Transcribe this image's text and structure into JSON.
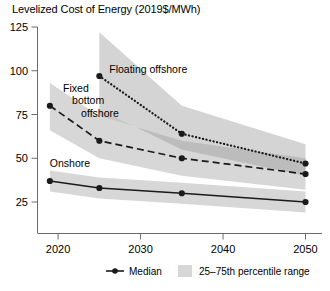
{
  "chart_data": {
    "type": "line",
    "title": "Levelized Cost of Energy (2019$/MWh)",
    "xlabel": "",
    "ylabel": "Levelized Cost of Energy (2019$/MWh)",
    "xlim": [
      2017.5,
      2052
    ],
    "ylim": [
      12,
      125
    ],
    "grid": false,
    "x_ticks": [
      "2020",
      "2030",
      "2040",
      "2050"
    ],
    "x_tick_values": [
      2020,
      2030,
      2040,
      2050
    ],
    "y_ticks": [
      "125",
      "100",
      "75",
      "50",
      "25"
    ],
    "y_tick_values": [
      125,
      100,
      75,
      50,
      25
    ],
    "x": [
      2019,
      2025,
      2035,
      2050
    ],
    "legend": {
      "position": "bottom",
      "entries": [
        {
          "label": "Median",
          "marker": "line-dot"
        },
        {
          "label": "25–75th percentile range",
          "marker": "band-swatch"
        }
      ]
    },
    "series": [
      {
        "name": "Floating offshore",
        "label": "Floating offshore",
        "line_style": "dotted",
        "x": [
          2025,
          2035,
          2050
        ],
        "values": [
          97,
          64,
          47
        ],
        "band_low": [
          78,
          55,
          40
        ],
        "band_high": [
          122,
          80,
          58
        ],
        "label_x": 2026.2,
        "label_y": 99
      },
      {
        "name": "Fixed bottom offshore",
        "label": "Fixed bottom offshore",
        "line_style": "dashed",
        "x": [
          2019,
          2025,
          2035,
          2050
        ],
        "values": [
          80,
          60,
          50,
          41
        ],
        "band_low": [
          66,
          50,
          40,
          32
        ],
        "band_high": [
          93,
          74,
          60,
          50
        ],
        "label_lines": [
          "Fixed",
          "bottom",
          "offshore"
        ],
        "label_x": 2020.6,
        "label_y": 88
      },
      {
        "name": "Onshore",
        "label": "Onshore",
        "line_style": "solid",
        "x": [
          2019,
          2025,
          2035,
          2050
        ],
        "values": [
          37,
          33,
          30,
          25
        ],
        "band_low": [
          31,
          27,
          24,
          19
        ],
        "band_high": [
          43,
          39,
          36,
          31
        ],
        "label_x": 2019.0,
        "label_y": 45
      }
    ],
    "colors": {
      "line": "#1a1a1a",
      "band": "#d6d6d6",
      "band_overlap": "#b0b0b0",
      "axis": "#6b6b6b",
      "text": "#000000",
      "background": "#ffffff"
    }
  }
}
